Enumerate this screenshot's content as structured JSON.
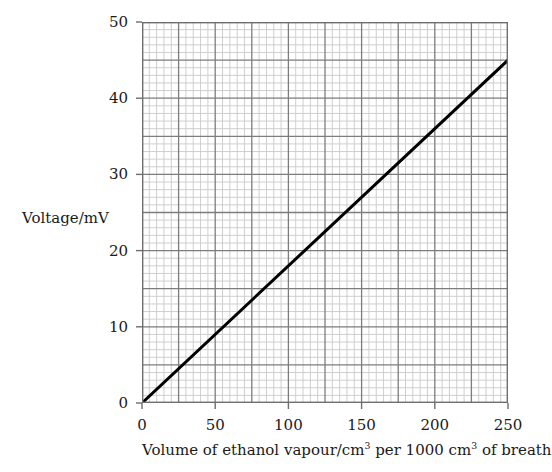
{
  "chart_data": {
    "type": "line",
    "title": "",
    "xlabel_parts": {
      "pre": "Volume of ethanol vapour/cm",
      "sup1": "3",
      "mid": " per 1000 cm",
      "sup2": "3",
      "post": " of breath"
    },
    "xlabel": "Volume of ethanol vapour/cm3 per 1000 cm3 of breath",
    "ylabel": "Voltage/mV",
    "xlim": [
      0,
      250
    ],
    "ylim": [
      0,
      50
    ],
    "xticks": [
      0,
      50,
      100,
      150,
      200,
      250
    ],
    "xtick_labels": [
      "0",
      "50",
      "100",
      "150",
      "200",
      "250"
    ],
    "yticks": [
      0,
      10,
      20,
      30,
      40,
      50
    ],
    "ytick_labels": [
      "0",
      "10",
      "20",
      "30",
      "40",
      "50"
    ],
    "grid": true,
    "grid_style": "graph-paper",
    "x_minor_step": 5,
    "x_major_step": 25,
    "y_minor_step": 1,
    "y_major_step": 5,
    "legend": false,
    "series": [
      {
        "name": "calibration line",
        "color": "#000000",
        "line_width": 3,
        "points": [
          {
            "x": 0,
            "y": 0
          },
          {
            "x": 250,
            "y": 45
          }
        ],
        "slope": 0.18,
        "intercept": 0
      }
    ],
    "colors": {
      "minor_grid": "#c9c9c9",
      "major_grid": "#7d7d7d",
      "axis": "#6e6e6e",
      "data_line": "#000000",
      "text": "#1a1a1a",
      "background": "#ffffff"
    }
  }
}
